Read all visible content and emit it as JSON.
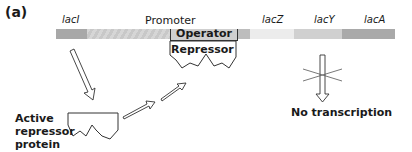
{
  "panel_label": "(a)",
  "genes": {
    "laci": "lacI",
    "promoter": "Promoter",
    "lacz": "lacZ",
    "lacy": "lacY",
    "laca": "lacA"
  },
  "operator_label": "Operator",
  "bound_repressor_label": "Repressor",
  "active_repressor_caption": [
    "Active",
    "repressor",
    "protein"
  ],
  "no_transcription_caption": "No transcription",
  "colors": {
    "laci": "#a8a8a8",
    "promoter": "#d4d4d4",
    "lacz": "#ececec",
    "lacy": "#d0d0d0",
    "laca": "#a9a9a9",
    "outline": "#333333"
  }
}
